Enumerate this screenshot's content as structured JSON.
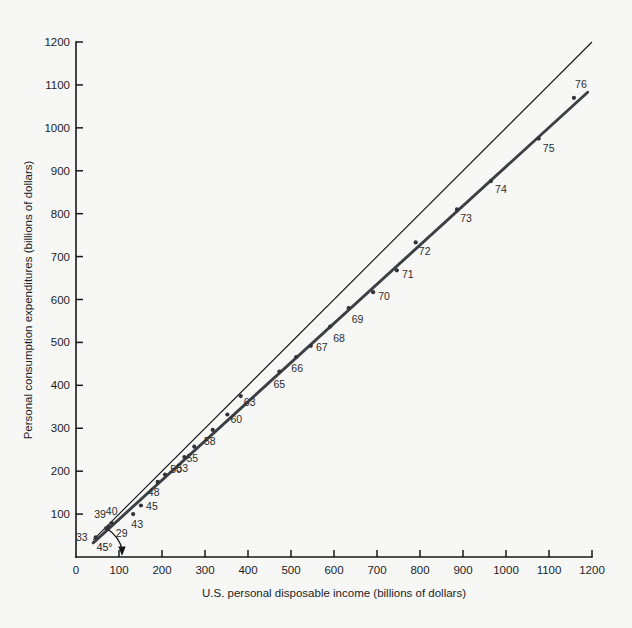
{
  "figure": {
    "background_color": "#f7f7f6",
    "ink_color": "#16181a",
    "fit_line_color": "#3c3f44"
  },
  "chart_data": {
    "type": "scatter",
    "title": "",
    "subtitle": "",
    "xlabel": "U.S. personal disposable income (billions of dollars)",
    "ylabel": "Personal consumption expenditures (billions of dollars)",
    "xlim": [
      0,
      1200
    ],
    "ylim": [
      0,
      1200
    ],
    "xticks": [
      0,
      100,
      200,
      300,
      400,
      500,
      600,
      700,
      800,
      900,
      1000,
      1100,
      1200
    ],
    "yticks": [
      0,
      100,
      200,
      300,
      400,
      500,
      600,
      700,
      800,
      900,
      1000,
      1100,
      1200
    ],
    "xtick_labels": [
      "0",
      "100",
      "200",
      "300",
      "400",
      "500",
      "600",
      "700",
      "800",
      "900",
      "1000",
      "1100",
      "1200"
    ],
    "ytick_labels": [
      "0",
      "100",
      "200",
      "300",
      "400",
      "500",
      "600",
      "700",
      "800",
      "900",
      "1000",
      "1100",
      "1200"
    ],
    "grid": false,
    "legend": null,
    "point_label_field": "year",
    "points": [
      {
        "year": "29",
        "x": 83,
        "y": 79
      },
      {
        "year": "33",
        "x": 46,
        "y": 46
      },
      {
        "year": "39",
        "x": 70,
        "y": 67
      },
      {
        "year": "40",
        "x": 76,
        "y": 71
      },
      {
        "year": "43",
        "x": 133,
        "y": 100
      },
      {
        "year": "45",
        "x": 151,
        "y": 120
      },
      {
        "year": "48",
        "x": 190,
        "y": 175
      },
      {
        "year": "50",
        "x": 207,
        "y": 192
      },
      {
        "year": "53",
        "x": 252,
        "y": 233
      },
      {
        "year": "55",
        "x": 275,
        "y": 257
      },
      {
        "year": "58",
        "x": 318,
        "y": 296
      },
      {
        "year": "60",
        "x": 352,
        "y": 332
      },
      {
        "year": "63",
        "x": 383,
        "y": 375
      },
      {
        "year": "65",
        "x": 473,
        "y": 432
      },
      {
        "year": "66",
        "x": 512,
        "y": 466
      },
      {
        "year": "67",
        "x": 546,
        "y": 492
      },
      {
        "year": "68",
        "x": 591,
        "y": 537
      },
      {
        "year": "69",
        "x": 634,
        "y": 580
      },
      {
        "year": "70",
        "x": 691,
        "y": 617
      },
      {
        "year": "71",
        "x": 746,
        "y": 668
      },
      {
        "year": "72",
        "x": 790,
        "y": 733
      },
      {
        "year": "73",
        "x": 886,
        "y": 810
      },
      {
        "year": "74",
        "x": 965,
        "y": 876
      },
      {
        "year": "75",
        "x": 1076,
        "y": 975
      },
      {
        "year": "76",
        "x": 1158,
        "y": 1070
      }
    ],
    "lines": [
      {
        "name": "45-degree-reference-line",
        "style": "thin",
        "x": [
          40,
          1200
        ],
        "y": [
          40,
          1200
        ]
      },
      {
        "name": "fitted-consumption-function",
        "style": "thick",
        "x": [
          40,
          1190
        ],
        "y": [
          33,
          1083
        ]
      }
    ],
    "annotations": [
      {
        "name": "45-degree-angle-label",
        "text": "45°",
        "x": 48,
        "y": 14
      }
    ]
  }
}
